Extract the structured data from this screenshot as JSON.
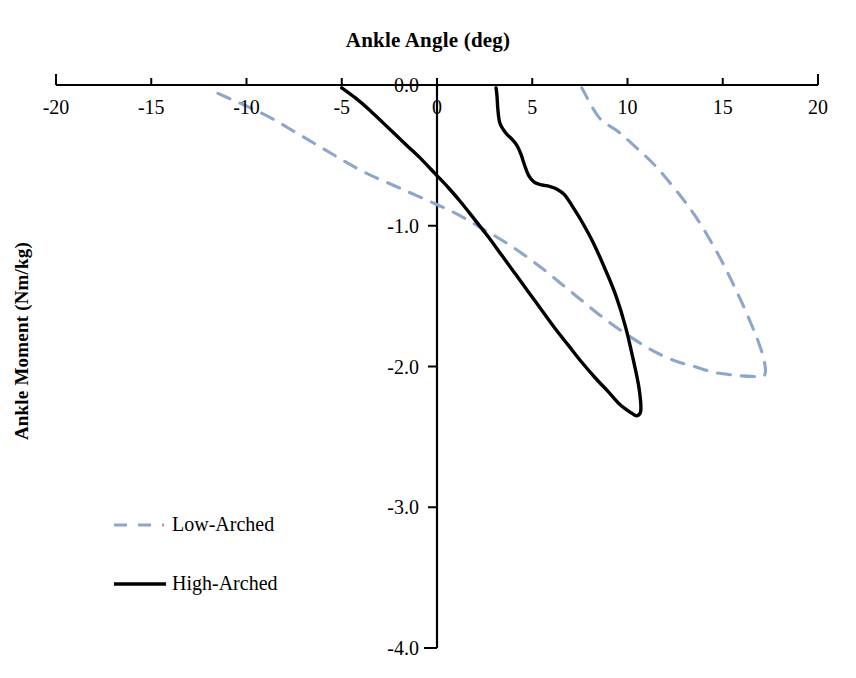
{
  "chart_data": {
    "type": "line",
    "title": "Ankle Angle (deg)",
    "xlabel": "Ankle Angle (deg)",
    "ylabel": "Ankle Moment (Nm/kg)",
    "xlim": [
      -20,
      20
    ],
    "ylim": [
      -4.0,
      0.0
    ],
    "xticks": [
      "-20",
      "-15",
      "-10",
      "-5",
      "0",
      "5",
      "10",
      "15",
      "20"
    ],
    "xtick_values": [
      -20,
      -15,
      -10,
      -5,
      0,
      5,
      10,
      15,
      20
    ],
    "yticks": [
      "0.0",
      "-1.0",
      "-2.0",
      "-3.0",
      "-4.0"
    ],
    "ytick_values": [
      0.0,
      -1.0,
      -2.0,
      -3.0,
      -4.0
    ],
    "grid": false,
    "legend_position": "lower-left",
    "xaxis_position": "top",
    "series": [
      {
        "name": "Low-Arched",
        "color": "#8ca6cc",
        "style": "dashed",
        "points": [
          [
            -11.5,
            -0.06
          ],
          [
            -10.5,
            -0.12
          ],
          [
            -9.5,
            -0.18
          ],
          [
            -8.5,
            -0.25
          ],
          [
            -7.5,
            -0.33
          ],
          [
            -6.5,
            -0.41
          ],
          [
            -5.5,
            -0.49
          ],
          [
            -4.5,
            -0.57
          ],
          [
            -3.5,
            -0.64
          ],
          [
            -2.5,
            -0.7
          ],
          [
            -1.5,
            -0.76
          ],
          [
            -0.5,
            -0.82
          ],
          [
            0.5,
            -0.88
          ],
          [
            1.5,
            -0.95
          ],
          [
            2.5,
            -1.03
          ],
          [
            3.5,
            -1.11
          ],
          [
            4.5,
            -1.2
          ],
          [
            5.5,
            -1.3
          ],
          [
            6.5,
            -1.41
          ],
          [
            7.5,
            -1.52
          ],
          [
            8.5,
            -1.63
          ],
          [
            9.5,
            -1.73
          ],
          [
            10.5,
            -1.82
          ],
          [
            11.5,
            -1.9
          ],
          [
            12.5,
            -1.96
          ],
          [
            13.5,
            -2.0
          ],
          [
            14.5,
            -2.04
          ],
          [
            15.5,
            -2.06
          ],
          [
            16.5,
            -2.07
          ],
          [
            17.2,
            -2.06
          ],
          [
            17.1,
            -1.92
          ],
          [
            16.5,
            -1.7
          ],
          [
            15.5,
            -1.4
          ],
          [
            14.5,
            -1.14
          ],
          [
            13.5,
            -0.92
          ],
          [
            12.5,
            -0.74
          ],
          [
            11.5,
            -0.58
          ],
          [
            10.5,
            -0.45
          ],
          [
            9.5,
            -0.33
          ],
          [
            8.5,
            -0.23
          ],
          [
            7.6,
            -0.02
          ]
        ]
      },
      {
        "name": "High-Arched",
        "color": "#000000",
        "style": "solid",
        "points": [
          [
            -5.0,
            -0.02
          ],
          [
            -4.3,
            -0.09
          ],
          [
            -3.6,
            -0.17
          ],
          [
            -2.9,
            -0.26
          ],
          [
            -2.2,
            -0.35
          ],
          [
            -1.5,
            -0.44
          ],
          [
            -0.8,
            -0.53
          ],
          [
            -0.1,
            -0.63
          ],
          [
            0.6,
            -0.73
          ],
          [
            1.3,
            -0.84
          ],
          [
            2.0,
            -0.96
          ],
          [
            2.7,
            -1.08
          ],
          [
            3.4,
            -1.21
          ],
          [
            4.1,
            -1.34
          ],
          [
            4.8,
            -1.47
          ],
          [
            5.5,
            -1.6
          ],
          [
            6.2,
            -1.73
          ],
          [
            6.9,
            -1.85
          ],
          [
            7.6,
            -1.97
          ],
          [
            8.3,
            -2.08
          ],
          [
            9.0,
            -2.18
          ],
          [
            9.6,
            -2.27
          ],
          [
            10.2,
            -2.33
          ],
          [
            10.5,
            -2.35
          ],
          [
            10.7,
            -2.31
          ],
          [
            10.6,
            -2.15
          ],
          [
            10.3,
            -1.95
          ],
          [
            9.9,
            -1.72
          ],
          [
            9.4,
            -1.5
          ],
          [
            8.8,
            -1.3
          ],
          [
            8.2,
            -1.12
          ],
          [
            7.6,
            -0.97
          ],
          [
            7.1,
            -0.86
          ],
          [
            6.7,
            -0.78
          ],
          [
            6.3,
            -0.74
          ],
          [
            5.9,
            -0.72
          ],
          [
            5.5,
            -0.71
          ],
          [
            5.1,
            -0.69
          ],
          [
            4.8,
            -0.64
          ],
          [
            4.6,
            -0.57
          ],
          [
            4.4,
            -0.49
          ],
          [
            4.2,
            -0.43
          ],
          [
            3.9,
            -0.38
          ],
          [
            3.6,
            -0.34
          ],
          [
            3.3,
            -0.27
          ],
          [
            3.2,
            -0.18
          ],
          [
            3.15,
            -0.08
          ],
          [
            3.1,
            -0.02
          ]
        ]
      }
    ]
  },
  "axis": {
    "x_tick_labels": [
      {
        "text": "-20",
        "value": -20
      },
      {
        "text": "-15",
        "value": -15
      },
      {
        "text": "-10",
        "value": -10
      },
      {
        "text": "-5",
        "value": -5
      },
      {
        "text": "0",
        "value": 0
      },
      {
        "text": "5",
        "value": 5
      },
      {
        "text": "10",
        "value": 10
      },
      {
        "text": "15",
        "value": 15
      },
      {
        "text": "20",
        "value": 20
      }
    ],
    "y_tick_labels": [
      {
        "text": "0.0",
        "value": 0.0
      },
      {
        "text": "-1.0",
        "value": -1.0
      },
      {
        "text": "-2.0",
        "value": -2.0
      },
      {
        "text": "-3.0",
        "value": -3.0
      },
      {
        "text": "-4.0",
        "value": -4.0
      }
    ]
  },
  "legend": {
    "items": [
      {
        "label": "Low-Arched",
        "color": "#8ca6cc",
        "style": "dashed"
      },
      {
        "label": "High-Arched",
        "color": "#000000",
        "style": "solid"
      }
    ]
  }
}
